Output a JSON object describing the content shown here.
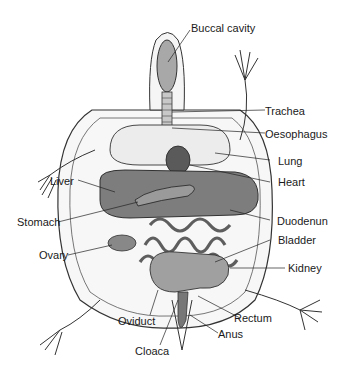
{
  "diagram": {
    "labels": {
      "buccal_cavity": "Buccal cavity",
      "trachea": "Trachea",
      "oesophagus": "Oesophagus",
      "lung": "Lung",
      "heart": "Heart",
      "liver": "Liver",
      "stomach": "Stomach",
      "duodenum": "Duodenun",
      "bladder": "Bladder",
      "ovary": "Ovary",
      "kidney": "Kidney",
      "rectum": "Rectum",
      "oviduct": "Oviduct",
      "anus": "Anus",
      "cloaca": "Cloaca"
    }
  }
}
